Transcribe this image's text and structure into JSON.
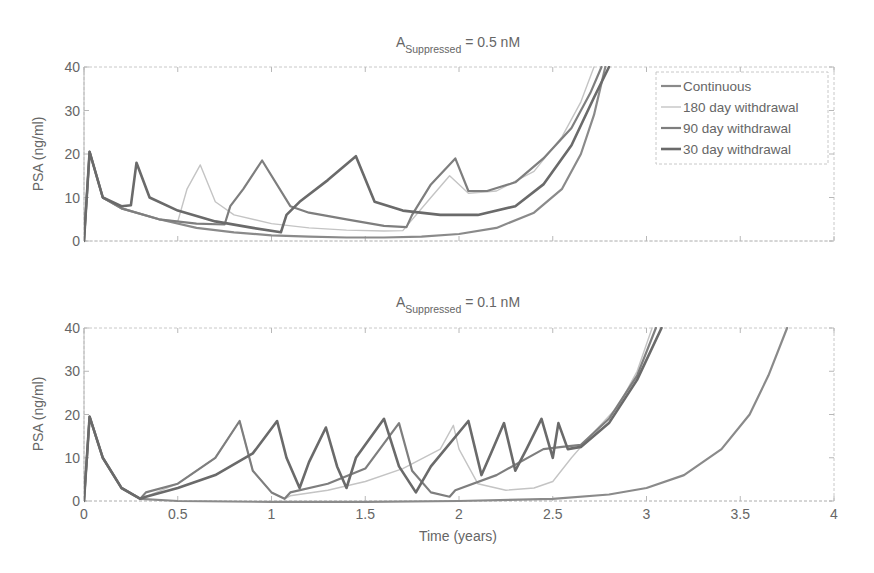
{
  "chart_data": [
    {
      "type": "line",
      "title": "A_Suppressed = 0.5 nM",
      "title_main": "A",
      "title_sub": "Suppressed",
      "title_rest": " = 0.5 nM",
      "xlabel": "",
      "ylabel": "PSA (ng/ml)",
      "xlim": [
        0,
        4
      ],
      "ylim": [
        0,
        40
      ],
      "xticks": [
        0,
        0.5,
        1,
        1.5,
        2,
        2.5,
        3,
        3.5,
        4
      ],
      "xtick_labels_visible": false,
      "yticks": [
        0,
        10,
        20,
        30,
        40
      ],
      "ytick_labels": [
        "0",
        "10",
        "20",
        "30",
        "40"
      ],
      "grid": false,
      "legend_position": "upper right",
      "series": [
        {
          "name": "Continuous",
          "color": "#8a8a8a",
          "width": 2.2,
          "x": [
            0,
            0.03,
            0.1,
            0.2,
            0.4,
            0.6,
            0.8,
            1.0,
            1.2,
            1.4,
            1.6,
            1.8,
            2.0,
            2.2,
            2.4,
            2.55,
            2.65,
            2.72,
            2.78
          ],
          "y": [
            0,
            20.5,
            10,
            7.5,
            5,
            3,
            2,
            1.3,
            1,
            0.8,
            0.8,
            1,
            1.6,
            3,
            6.5,
            12,
            20,
            29,
            40
          ]
        },
        {
          "name": "180 day withdrawal",
          "color": "#c4c4c4",
          "width": 1.4,
          "x": [
            0,
            0.03,
            0.1,
            0.2,
            0.4,
            0.5,
            0.55,
            0.62,
            0.7,
            0.8,
            1.0,
            1.2,
            1.4,
            1.6,
            1.7,
            1.85,
            1.95,
            2.05,
            2.2,
            2.4,
            2.55,
            2.65,
            2.72
          ],
          "y": [
            0,
            20.5,
            10,
            7.5,
            5,
            4.5,
            12,
            17.5,
            9,
            6,
            4,
            3,
            2.5,
            2.3,
            2.4,
            10,
            15,
            11,
            11.5,
            16,
            24,
            32,
            40
          ]
        },
        {
          "name": "90 day withdrawal",
          "color": "#7e7e7e",
          "width": 2.2,
          "x": [
            0,
            0.03,
            0.1,
            0.2,
            0.4,
            0.6,
            0.75,
            0.78,
            0.85,
            0.95,
            1.1,
            1.2,
            1.4,
            1.6,
            1.72,
            1.75,
            1.85,
            1.98,
            2.05,
            2.15,
            2.3,
            2.45,
            2.6,
            2.7,
            2.76
          ],
          "y": [
            0,
            20.5,
            10,
            7.5,
            5,
            4,
            3.8,
            8,
            12,
            18.5,
            8,
            6.5,
            5,
            3.5,
            3.2,
            6,
            13,
            19,
            11.5,
            11.5,
            13.5,
            19,
            26,
            34,
            40
          ]
        },
        {
          "name": "30 day withdrawal",
          "color": "#6a6a6a",
          "width": 2.6,
          "x": [
            0,
            0.03,
            0.1,
            0.2,
            0.25,
            0.28,
            0.35,
            0.5,
            0.7,
            0.9,
            1.05,
            1.08,
            1.15,
            1.3,
            1.45,
            1.55,
            1.7,
            1.9,
            2.1,
            2.3,
            2.45,
            2.6,
            2.72,
            2.8
          ],
          "y": [
            0,
            20.5,
            10,
            8,
            8.2,
            18,
            10,
            7,
            4.5,
            3,
            2,
            6,
            9,
            14,
            19.5,
            9,
            7,
            6,
            6,
            8,
            13,
            22,
            33,
            40
          ]
        }
      ]
    },
    {
      "type": "line",
      "title": "A_Suppressed = 0.1 nM",
      "title_main": "A",
      "title_sub": "Suppressed",
      "title_rest": " = 0.1 nM",
      "xlabel": "Time (years)",
      "ylabel": "PSA (ng/ml)",
      "xlim": [
        0,
        4
      ],
      "ylim": [
        0,
        40
      ],
      "xticks": [
        0,
        0.5,
        1,
        1.5,
        2,
        2.5,
        3,
        3.5,
        4
      ],
      "xtick_labels": [
        "0",
        "0.5",
        "1",
        "1.5",
        "2",
        "2.5",
        "3",
        "3.5",
        "4"
      ],
      "yticks": [
        0,
        10,
        20,
        30,
        40
      ],
      "ytick_labels": [
        "0",
        "10",
        "20",
        "30",
        "40"
      ],
      "grid": false,
      "series": [
        {
          "name": "Continuous",
          "color": "#8a8a8a",
          "width": 2.2,
          "x": [
            0,
            0.03,
            0.1,
            0.2,
            0.3,
            0.5,
            1.0,
            1.5,
            2.0,
            2.5,
            2.8,
            3.0,
            3.2,
            3.4,
            3.55,
            3.65,
            3.75
          ],
          "y": [
            0,
            19.5,
            10,
            3,
            0.5,
            0,
            -0.2,
            -0.2,
            0,
            0.5,
            1.5,
            3,
            6,
            12,
            20,
            29,
            40
          ]
        },
        {
          "name": "180 day withdrawal",
          "color": "#c4c4c4",
          "width": 1.4,
          "x": [
            0,
            0.03,
            0.1,
            0.2,
            0.3,
            0.5,
            0.7,
            0.83,
            0.9,
            1.0,
            1.07,
            1.1,
            1.3,
            1.5,
            1.7,
            1.9,
            1.97,
            2.0,
            2.1,
            2.25,
            2.4,
            2.5,
            2.6,
            2.7,
            2.85,
            2.95,
            3.03
          ],
          "y": [
            0,
            19.5,
            10,
            3,
            0.5,
            4,
            10,
            18.5,
            7,
            2,
            0.5,
            1.2,
            2.5,
            4.5,
            7.5,
            12,
            17.5,
            12,
            4,
            2.5,
            3,
            4.5,
            10,
            15,
            22,
            30,
            40
          ]
        },
        {
          "name": "90 day withdrawal",
          "color": "#7e7e7e",
          "width": 2.2,
          "x": [
            0,
            0.03,
            0.1,
            0.2,
            0.3,
            0.33,
            0.5,
            0.7,
            0.83,
            0.9,
            1.0,
            1.07,
            1.1,
            1.3,
            1.5,
            1.68,
            1.75,
            1.85,
            1.95,
            1.98,
            2.2,
            2.45,
            2.55,
            2.65,
            2.8,
            2.95,
            3.05
          ],
          "y": [
            0,
            19.5,
            10,
            3,
            0.5,
            2,
            4,
            10,
            18.5,
            7,
            2,
            0.5,
            2,
            4,
            7.5,
            18,
            7,
            2,
            1,
            2.5,
            6,
            12,
            12.5,
            13,
            19,
            29,
            40
          ]
        },
        {
          "name": "30 day withdrawal",
          "color": "#6a6a6a",
          "width": 2.6,
          "x": [
            0,
            0.03,
            0.1,
            0.2,
            0.3,
            0.33,
            0.5,
            0.7,
            0.9,
            1.03,
            1.08,
            1.15,
            1.2,
            1.29,
            1.35,
            1.4,
            1.45,
            1.6,
            1.68,
            1.77,
            1.85,
            2.05,
            2.12,
            2.17,
            2.24,
            2.3,
            2.36,
            2.44,
            2.5,
            2.53,
            2.58,
            2.65,
            2.8,
            2.95,
            3.08
          ],
          "y": [
            0,
            19.5,
            10,
            3,
            0.5,
            1,
            3,
            6,
            11,
            18.5,
            10,
            3,
            9,
            17,
            8,
            3,
            10,
            19,
            8,
            2,
            8,
            18.5,
            6,
            11,
            18,
            7,
            12,
            19,
            10,
            18,
            12,
            12.5,
            18,
            28,
            40
          ]
        }
      ]
    }
  ],
  "legend": {
    "items": [
      {
        "label": "Continuous",
        "color": "#8a8a8a",
        "width": 2.2
      },
      {
        "label": "180 day withdrawal",
        "color": "#c4c4c4",
        "width": 1.4
      },
      {
        "label": "90 day withdrawal",
        "color": "#7e7e7e",
        "width": 2.2
      },
      {
        "label": "30 day withdrawal",
        "color": "#6a6a6a",
        "width": 2.6
      }
    ]
  },
  "colors": {
    "axis": "#b0b0b0",
    "text": "#666666"
  }
}
